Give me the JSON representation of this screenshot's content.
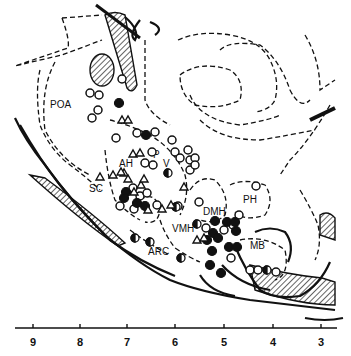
{
  "diagram": {
    "type": "brain-atlas-sagittal-section",
    "region_labels": [
      {
        "id": "poa",
        "text": "POA",
        "x": 50,
        "y": 108
      },
      {
        "id": "p",
        "text": "P",
        "x": 153,
        "y": 158
      },
      {
        "id": "v",
        "text": "V",
        "x": 163,
        "y": 167
      },
      {
        "id": "ah",
        "text": "AH",
        "x": 119,
        "y": 167
      },
      {
        "id": "sc",
        "text": "SC",
        "x": 89,
        "y": 192
      },
      {
        "id": "ph",
        "text": "PH",
        "x": 243,
        "y": 203
      },
      {
        "id": "dmh",
        "text": "DMH",
        "x": 203,
        "y": 215
      },
      {
        "id": "vmh",
        "text": "VMH",
        "x": 172,
        "y": 232
      },
      {
        "id": "mb",
        "text": "MB",
        "x": 250,
        "y": 249
      },
      {
        "id": "arc",
        "text": "ARC",
        "x": 148,
        "y": 255
      }
    ],
    "axis": {
      "ticks": [
        {
          "label": "9",
          "x": 33
        },
        {
          "label": "8",
          "x": 80
        },
        {
          "label": "7",
          "x": 127
        },
        {
          "label": "6",
          "x": 175
        },
        {
          "label": "5",
          "x": 224
        },
        {
          "label": "4",
          "x": 273
        },
        {
          "label": "3",
          "x": 321
        }
      ]
    },
    "legend_symbols": {
      "open_circle": "open-circle",
      "filled_circle": "filled-circle",
      "half_filled_circle": "half-filled-circle",
      "open_triangle": "open-triangle"
    }
  }
}
